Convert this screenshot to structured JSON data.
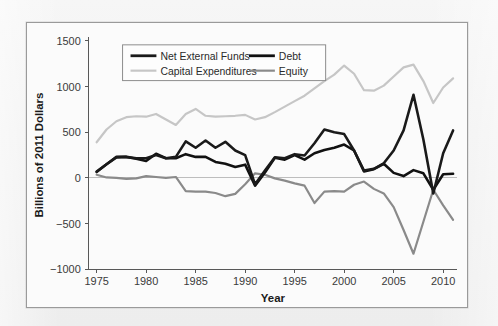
{
  "figure": {
    "background_color": "#fbfbfb",
    "frame_color": "#9a9a9a"
  },
  "chart_data": {
    "type": "line",
    "title": "",
    "xlabel": "Year",
    "ylabel": "Billions of 2011 Dollars",
    "xlim": [
      1974.2,
      2011.4
    ],
    "ylim": [
      -1000,
      1500
    ],
    "xticks": [
      1975,
      1980,
      1985,
      1990,
      1995,
      2000,
      2005,
      2010
    ],
    "xtick_labels": [
      "1975",
      "1980",
      "1985",
      "1990",
      "1995",
      "2000",
      "2005",
      "2010"
    ],
    "yticks": [
      -1000,
      -500,
      0,
      500,
      1000,
      1500
    ],
    "ytick_labels": [
      "−1000",
      "−500",
      "0",
      "500",
      "1000",
      "1500"
    ],
    "grid": false,
    "zero_line": true,
    "legend_position": "top-center",
    "x": [
      1975,
      1976,
      1977,
      1978,
      1979,
      1980,
      1981,
      1982,
      1983,
      1984,
      1985,
      1986,
      1987,
      1988,
      1989,
      1990,
      1991,
      1992,
      1993,
      1994,
      1995,
      1996,
      1997,
      1998,
      1999,
      2000,
      2001,
      2002,
      2003,
      2004,
      2005,
      2006,
      2007,
      2008,
      2009,
      2010,
      2011
    ],
    "series": [
      {
        "name": "Net External Funds",
        "color": "#1a1a1a",
        "width": 2.6,
        "values": [
          70,
          150,
          225,
          230,
          215,
          215,
          250,
          215,
          230,
          400,
          330,
          410,
          330,
          395,
          300,
          250,
          -70,
          80,
          225,
          215,
          260,
          245,
          380,
          530,
          500,
          480,
          300,
          80,
          100,
          160,
          300,
          520,
          910,
          420,
          -170,
          270,
          520
        ]
      },
      {
        "name": "Debt",
        "color": "#111111",
        "width": 2.6,
        "values": [
          65,
          150,
          230,
          230,
          210,
          185,
          265,
          215,
          215,
          260,
          230,
          230,
          175,
          155,
          120,
          145,
          -85,
          60,
          220,
          200,
          250,
          200,
          270,
          305,
          330,
          365,
          300,
          70,
          95,
          155,
          55,
          20,
          85,
          50,
          -130,
          40,
          45
        ]
      },
      {
        "name": "Capital Expenditures",
        "color": "#c6c6c6",
        "width": 2.2,
        "values": [
          390,
          530,
          620,
          665,
          675,
          670,
          700,
          640,
          580,
          700,
          755,
          680,
          670,
          675,
          680,
          690,
          640,
          665,
          720,
          780,
          840,
          900,
          980,
          1060,
          1130,
          1230,
          1140,
          960,
          955,
          1010,
          1110,
          1210,
          1240,
          1060,
          820,
          990,
          1090
        ]
      },
      {
        "name": "Equity",
        "color": "#8a8a8a",
        "width": 2.2,
        "values": [
          35,
          5,
          0,
          -10,
          -5,
          20,
          10,
          0,
          10,
          -145,
          -150,
          -150,
          -165,
          -200,
          -175,
          -70,
          50,
          35,
          -5,
          -30,
          -60,
          -85,
          -275,
          -150,
          -145,
          -150,
          -75,
          -40,
          -120,
          -170,
          -320,
          -570,
          -830,
          -480,
          -130,
          -300,
          -460
        ]
      }
    ]
  },
  "legend": {
    "entries": [
      {
        "label": "Net External Funds",
        "color": "#1a1a1a",
        "width": 2.8
      },
      {
        "label": "Debt",
        "color": "#111111",
        "width": 2.8
      },
      {
        "label": "Capital Expenditures",
        "color": "#c6c6c6",
        "width": 2.2
      },
      {
        "label": "Equity",
        "color": "#8a8a8a",
        "width": 2.2
      }
    ]
  }
}
